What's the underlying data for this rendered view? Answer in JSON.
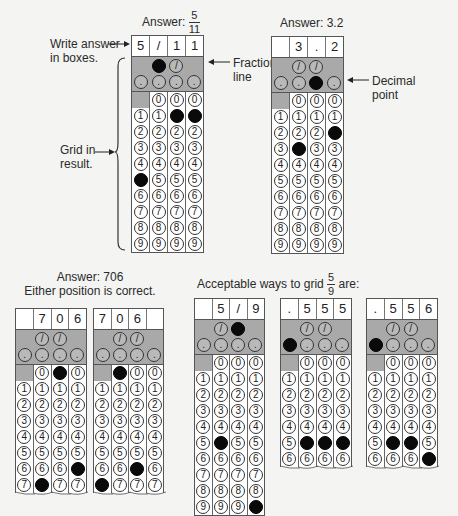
{
  "top_left": {
    "answer_label": "Answer:",
    "answer_num": "5",
    "answer_den": "11",
    "write_label_1": "Write answer",
    "write_label_2": "in boxes.",
    "fraction_label_1": "Fraction",
    "fraction_label_2": "line",
    "grid_label_1": "Grid in",
    "grid_label_2": "result.",
    "grid": {
      "boxes": [
        "5",
        "/",
        "1",
        "1"
      ],
      "slash_cols": [
        false,
        true,
        true,
        false
      ],
      "filled_slash": [
        false,
        true,
        false,
        false
      ],
      "filled_dot": [
        false,
        false,
        false,
        false
      ],
      "zero_cols": [
        false,
        true,
        true,
        true
      ],
      "filled_digit": [
        5,
        null,
        1,
        1
      ],
      "rows": 9
    }
  },
  "top_right": {
    "answer_label": "Answer: 3.2",
    "decimal_label_1": "Decimal",
    "decimal_label_2": "point",
    "grid": {
      "boxes": [
        "",
        "3",
        ".",
        "2"
      ],
      "slash_cols": [
        false,
        true,
        true,
        false
      ],
      "filled_slash": [
        false,
        false,
        false,
        false
      ],
      "filled_dot": [
        false,
        false,
        true,
        false
      ],
      "zero_cols": [
        false,
        true,
        true,
        true
      ],
      "filled_digit": [
        null,
        3,
        null,
        2
      ],
      "rows": 9
    }
  },
  "bottom_left": {
    "answer_label": "Answer: 706",
    "note": "Either position is correct.",
    "grids": [
      {
        "boxes": [
          "",
          "7",
          "0",
          "6"
        ],
        "slash_cols": [
          false,
          true,
          true,
          false
        ],
        "filled_slash": [
          false,
          false,
          false,
          false
        ],
        "filled_dot": [
          false,
          false,
          false,
          false
        ],
        "zero_cols": [
          false,
          true,
          true,
          true
        ],
        "filled_zero": [
          false,
          false,
          true,
          false
        ],
        "filled_digit": [
          null,
          7,
          null,
          6
        ],
        "rows": 7
      },
      {
        "boxes": [
          "7",
          "0",
          "6",
          ""
        ],
        "slash_cols": [
          false,
          true,
          true,
          false
        ],
        "filled_slash": [
          false,
          false,
          false,
          false
        ],
        "filled_dot": [
          false,
          false,
          false,
          false
        ],
        "zero_cols": [
          false,
          true,
          true,
          true
        ],
        "filled_zero": [
          false,
          true,
          false,
          false
        ],
        "filled_digit": [
          7,
          null,
          6,
          null
        ],
        "rows": 7
      }
    ]
  },
  "bottom_right": {
    "title_prefix": "Acceptable ways to grid",
    "title_num": "5",
    "title_den": "9",
    "title_suffix": "are:",
    "grids": [
      {
        "boxes": [
          "",
          "5",
          "/",
          "9"
        ],
        "slash_cols": [
          false,
          true,
          true,
          false
        ],
        "filled_slash": [
          false,
          false,
          true,
          false
        ],
        "filled_dot": [
          false,
          false,
          false,
          false
        ],
        "zero_cols": [
          false,
          true,
          true,
          true
        ],
        "filled_digit": [
          null,
          5,
          null,
          9
        ],
        "rows": 9
      },
      {
        "boxes": [
          ".",
          "5",
          "5",
          "5"
        ],
        "slash_cols": [
          false,
          true,
          true,
          false
        ],
        "filled_slash": [
          false,
          false,
          false,
          false
        ],
        "filled_dot": [
          true,
          false,
          false,
          false
        ],
        "zero_cols": [
          false,
          true,
          true,
          true
        ],
        "filled_digit": [
          null,
          5,
          5,
          5
        ],
        "rows": 6
      },
      {
        "boxes": [
          ".",
          "5",
          "5",
          "6"
        ],
        "slash_cols": [
          false,
          true,
          true,
          false
        ],
        "filled_slash": [
          false,
          false,
          false,
          false
        ],
        "filled_dot": [
          true,
          false,
          false,
          false
        ],
        "zero_cols": [
          false,
          true,
          true,
          true
        ],
        "filled_digit": [
          null,
          5,
          5,
          6
        ],
        "rows": 6
      }
    ]
  }
}
